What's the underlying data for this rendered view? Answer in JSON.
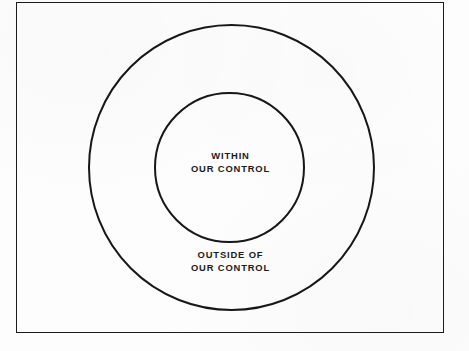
{
  "diagram": {
    "type": "concentric-circles",
    "frame": {
      "present": true,
      "stroke_color": "#1b1b1b"
    },
    "background_color": "#fdfdfd",
    "stroke_color": "#171717",
    "text_color": "#1c1c1c",
    "regions": [
      {
        "id": "inner",
        "name": "within-our-control",
        "label_line_1": "WITHIN",
        "label_line_2": "OUR CONTROL",
        "shape": "circle",
        "fill": "none"
      },
      {
        "id": "outer",
        "name": "outside-our-control",
        "label_line_1": "OUTSIDE OF",
        "label_line_2": "OUR CONTROL",
        "shape": "circle",
        "fill": "none"
      }
    ]
  }
}
